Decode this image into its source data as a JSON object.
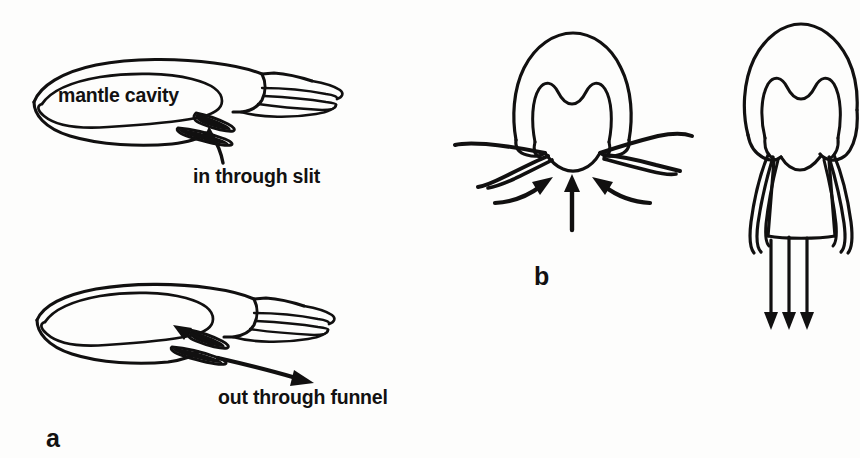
{
  "figure": {
    "background_color": "#fdfdfc",
    "ink_color": "#111010",
    "width": 860,
    "height": 458
  },
  "panels": [
    {
      "id": "a",
      "label": "a",
      "description": "Lateral view of squid showing water intake and expulsion",
      "annotations": [
        {
          "id": "mantle-cavity",
          "text": "mantle cavity"
        },
        {
          "id": "in-slit",
          "text": "in through slit"
        },
        {
          "id": "out-funnel",
          "text": "out through funnel"
        }
      ]
    },
    {
      "id": "b",
      "label": "b",
      "description": "Ventral views: water drawn in around collar, then jetted out posteriorly",
      "annotations": []
    }
  ],
  "labels": {
    "mantle_cavity": "mantle cavity",
    "in_through_slit": "in through slit",
    "out_through_funnel": "out through funnel",
    "panel_a": "a",
    "panel_b": "b"
  }
}
